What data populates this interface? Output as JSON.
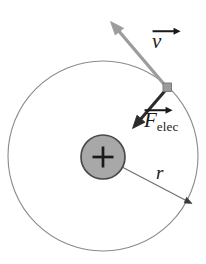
{
  "figure": {
    "width": 206,
    "height": 264,
    "background_color": "#ffffff"
  },
  "labels": {
    "velocity": {
      "symbol": "v",
      "accent": "vector-arrow",
      "text": "v"
    },
    "force": {
      "symbol": "F",
      "accent": "vector-arrow",
      "subscript": "elec",
      "text": "F"
    },
    "radius": {
      "symbol": "r",
      "text": "r"
    },
    "charge": {
      "symbol": "+",
      "text": "+"
    }
  },
  "colors": {
    "orbit_stroke": "#8a8a8a",
    "nucleus_fill": "#a8a8a8",
    "nucleus_stroke": "#4a4a4a",
    "electron_fill": "#9a9a9a",
    "electron_stroke": "#777777",
    "velocity_arrow": "#9c9c9c",
    "force_arrow": "#2b2b2b",
    "radius_arrow": "#6f6f6f",
    "plus_sign": "#1a1a1a",
    "label_text": "#1a1a1a"
  },
  "geometry": {
    "orbit": {
      "cx": 103,
      "cy": 156,
      "r": 95,
      "stroke_width": 1.1
    },
    "nucleus": {
      "cx": 103,
      "cy": 157,
      "r": 22,
      "stroke_width": 1.6
    },
    "electron": {
      "x": 167,
      "y": 87,
      "size": 8
    },
    "velocity_vector": {
      "x1": 166,
      "y1": 86,
      "x2": 112,
      "y2": 22,
      "stroke_width": 3.2
    },
    "force_vector": {
      "x1": 167,
      "y1": 89,
      "x2": 133,
      "y2": 128,
      "stroke_width": 3.0
    },
    "radius_vector": {
      "x1": 103,
      "y1": 157,
      "x2": 191,
      "y2": 203,
      "stroke_width": 1.1
    },
    "plus_sign": {
      "cx": 103,
      "cy": 157,
      "half_len": 11,
      "stroke_width": 2.6
    }
  }
}
